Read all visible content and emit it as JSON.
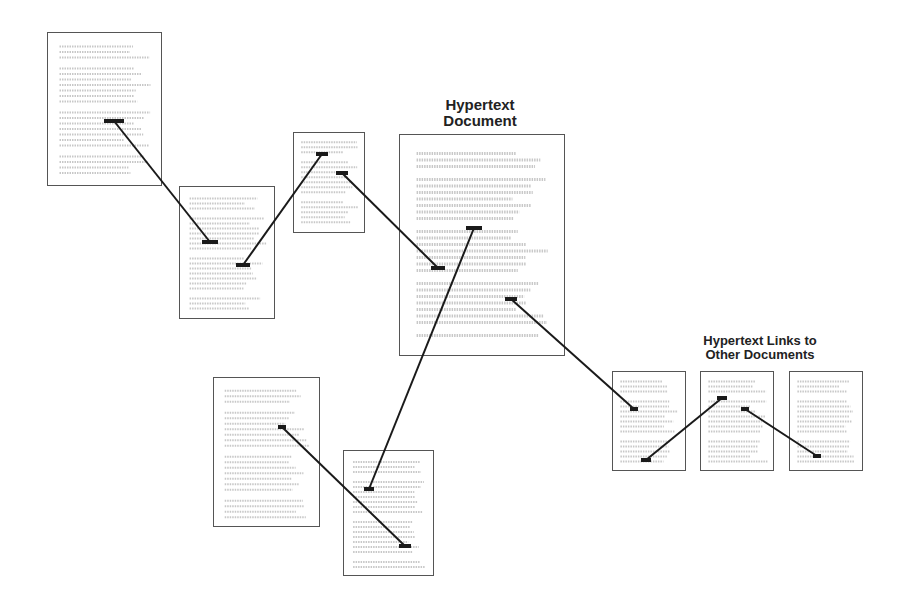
{
  "labels": {
    "main": [
      "Hypertext",
      "Document"
    ],
    "links": [
      "Hypertext Links to",
      "Other Documents"
    ]
  },
  "colors": {
    "line": "#1a1a1a",
    "border": "#555555",
    "text_lines": "#c8c8c8"
  },
  "documents": [
    {
      "id": "doc-top-left",
      "x": 47,
      "y": 32,
      "w": 115,
      "h": 154
    },
    {
      "id": "doc-small-left",
      "x": 179,
      "y": 186,
      "w": 96,
      "h": 133
    },
    {
      "id": "doc-small-top",
      "x": 293,
      "y": 132,
      "w": 72,
      "h": 101
    },
    {
      "id": "doc-main",
      "x": 399,
      "y": 134,
      "w": 166,
      "h": 222
    },
    {
      "id": "doc-bottom-left",
      "x": 213,
      "y": 377,
      "w": 107,
      "h": 150
    },
    {
      "id": "doc-bottom-mid",
      "x": 343,
      "y": 450,
      "w": 91,
      "h": 126
    },
    {
      "id": "doc-right-1",
      "x": 612,
      "y": 371,
      "w": 74,
      "h": 100
    },
    {
      "id": "doc-right-2",
      "x": 700,
      "y": 371,
      "w": 74,
      "h": 100
    },
    {
      "id": "doc-right-3",
      "x": 789,
      "y": 371,
      "w": 74,
      "h": 100
    }
  ],
  "links": [
    {
      "x1": 114,
      "y1": 121,
      "x2": 210,
      "y2": 242
    },
    {
      "x1": 243,
      "y1": 265,
      "x2": 322,
      "y2": 154
    },
    {
      "x1": 342,
      "y1": 173,
      "x2": 438,
      "y2": 268
    },
    {
      "x1": 474,
      "y1": 228,
      "x2": 369,
      "y2": 489
    },
    {
      "x1": 282,
      "y1": 427,
      "x2": 405,
      "y2": 546
    },
    {
      "x1": 511,
      "y1": 299,
      "x2": 634,
      "y2": 409
    },
    {
      "x1": 646,
      "y1": 460,
      "x2": 722,
      "y2": 398
    },
    {
      "x1": 745,
      "y1": 409,
      "x2": 817,
      "y2": 456
    }
  ],
  "anchors": [
    {
      "x": 114,
      "y": 121,
      "w": 20
    },
    {
      "x": 210,
      "y": 242,
      "w": 16
    },
    {
      "x": 243,
      "y": 265,
      "w": 14
    },
    {
      "x": 322,
      "y": 154,
      "w": 12
    },
    {
      "x": 342,
      "y": 173,
      "w": 12
    },
    {
      "x": 438,
      "y": 268,
      "w": 14
    },
    {
      "x": 474,
      "y": 228,
      "w": 16
    },
    {
      "x": 369,
      "y": 489,
      "w": 10
    },
    {
      "x": 282,
      "y": 427,
      "w": 8
    },
    {
      "x": 405,
      "y": 546,
      "w": 12
    },
    {
      "x": 511,
      "y": 299,
      "w": 12
    },
    {
      "x": 634,
      "y": 409,
      "w": 8
    },
    {
      "x": 646,
      "y": 460,
      "w": 10
    },
    {
      "x": 722,
      "y": 398,
      "w": 10
    },
    {
      "x": 745,
      "y": 409,
      "w": 8
    },
    {
      "x": 817,
      "y": 456,
      "w": 8
    }
  ]
}
